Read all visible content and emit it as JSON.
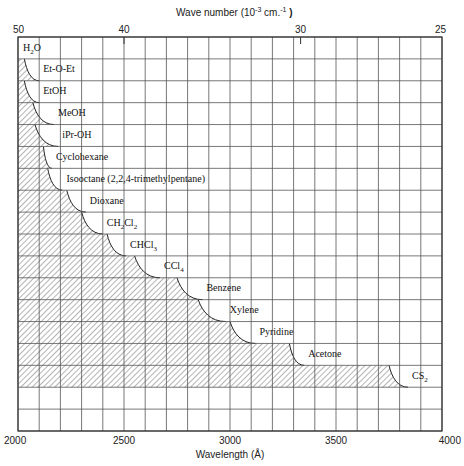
{
  "chart_data": {
    "type": "bar",
    "subtype": "horizontal-range-cutoff",
    "title": "",
    "xlabel": "Wavelength (Å)",
    "x2label": "Wave number (10⁻³ cm.⁻¹)",
    "xlim": [
      2000,
      4000
    ],
    "xticks": [
      2000,
      2500,
      3000,
      3500,
      4000
    ],
    "x2ticks": [
      {
        "label": "50",
        "wavelength": 2000
      },
      {
        "label": "40",
        "wavelength": 2500
      },
      {
        "label": "30",
        "wavelength": 3333
      },
      {
        "label": "25",
        "wavelength": 4000
      }
    ],
    "grid": true,
    "grid_x_step": 100,
    "rows": 18,
    "categories": [
      "H₂O",
      "Et-O-Et",
      "EtOH",
      "MeOH",
      "iPr-OH",
      "Cyclohexane",
      "Isooctane (2,2,4-trimethylpentane)",
      "Dioxane",
      "CH₂Cl₂",
      "CHCl₃",
      "CCl₄",
      "Benzene",
      "Xylene",
      "Pyridine",
      "Acetone",
      "CS₂"
    ],
    "series": [
      {
        "name": "transparency onset (top of curve)",
        "values": [
          2000,
          2030,
          2030,
          2070,
          2080,
          2120,
          2140,
          2230,
          2300,
          2420,
          2550,
          2750,
          2850,
          3000,
          3280,
          3750
        ]
      },
      {
        "name": "cutoff wavelength",
        "values": [
          2000,
          2100,
          2100,
          2170,
          2190,
          2160,
          2210,
          2320,
          2400,
          2510,
          2670,
          2870,
          2980,
          3120,
          3350,
          3840
        ]
      }
    ],
    "legend": "hatched region = opaque (solvent absorbs); label placed at cutoff"
  },
  "labels": {
    "top_axis_title": "Wave number (10",
    "top_axis_title_exp": "-3",
    "top_axis_title_unit": " cm.",
    "top_axis_title_unit_exp": "-1",
    "top_axis_title_close": ")",
    "bottom_axis_title": "Wavelength (Å)",
    "top_ticks": [
      "50",
      "40",
      "30",
      "25"
    ],
    "bottom_ticks": [
      "2000",
      "2500",
      "3000",
      "3500",
      "4000"
    ]
  },
  "solvents": [
    {
      "label": "H",
      "sub": "2",
      "tail": "O"
    },
    {
      "label": "Et-O-Et"
    },
    {
      "label": "EtOH"
    },
    {
      "label": "MeOH"
    },
    {
      "label": "iPr-OH"
    },
    {
      "label": "Cyclohexane"
    },
    {
      "label": "Isooctane (2,2,4-trimethylpentane)"
    },
    {
      "label": "Dioxane"
    },
    {
      "label": "CH",
      "sub": "2",
      "tail": "Cl",
      "sub2": "2"
    },
    {
      "label": "CHCl",
      "sub": "3"
    },
    {
      "label": "CCl",
      "sub": "4"
    },
    {
      "label": "Benzene"
    },
    {
      "label": "Xylene"
    },
    {
      "label": "Pyridine"
    },
    {
      "label": "Acetone"
    },
    {
      "label": "CS",
      "sub": "2"
    }
  ],
  "colors": {
    "grid": "#555555",
    "border": "#333333",
    "hatch": "#444444",
    "text": "#111111",
    "background": "#ffffff"
  }
}
